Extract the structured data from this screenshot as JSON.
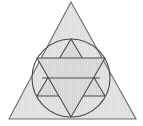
{
  "figure": {
    "canvas": {
      "width": 143,
      "height": 126,
      "background": "#ffffff"
    },
    "colors": {
      "fill_light": "#e3e3e3",
      "fill_mid": "#dcdcdc",
      "stroke_outer": "#6d6d6d",
      "stroke_inner": "#4a4a4a",
      "hatch": "#cfcfcf",
      "background": "#ffffff"
    },
    "shapes": [
      {
        "id": "outer-triangle",
        "kind": "triangle",
        "orientation": "up",
        "points": "71,2 136,119 9,119",
        "fill": "#e3e3e3",
        "stroke": "#6d6d6d",
        "stroke_width": 1.1,
        "label": "outer triangle"
      },
      {
        "id": "inscribed-circle",
        "kind": "circle",
        "cx": 71,
        "cy": 78,
        "r": 39,
        "fill": "none",
        "stroke": "#4a4a4a",
        "stroke_width": 1.1,
        "label": "inscribed circle"
      },
      {
        "id": "hexagram-up-triangle",
        "kind": "triangle",
        "orientation": "up",
        "points": "71,39 105,96 37,96",
        "fill": "#dcdcdc",
        "stroke": "#4a4a4a",
        "stroke_width": 1.1,
        "label": "hexagram upward triangle"
      },
      {
        "id": "hexagram-down-triangle",
        "kind": "triangle",
        "orientation": "down",
        "points": "71,117 37,58 105,58",
        "fill": "#dcdcdc",
        "stroke": "#4a4a4a",
        "stroke_width": 1.1,
        "label": "hexagram downward triangle"
      },
      {
        "id": "hexagon-midline",
        "kind": "line",
        "x1": 42,
        "y1": 78,
        "x2": 100,
        "y2": 78,
        "stroke": "#4a4a4a",
        "stroke_width": 1.1,
        "label": "hexagon horizontal midline"
      }
    ],
    "measurements": {
      "triangle_apex": "(71, 2)",
      "triangle_base_left": "(9, 119)",
      "triangle_base_right": "(136, 119)",
      "circle_center": "(71, 78)",
      "circle_radius": "39",
      "hexagram_top_vertex": "(71, 39)",
      "hexagram_bottom_vertex": "(71, 117)",
      "hexagram_upper_chord_y": "58",
      "hexagram_lower_chord_y": "96"
    }
  }
}
